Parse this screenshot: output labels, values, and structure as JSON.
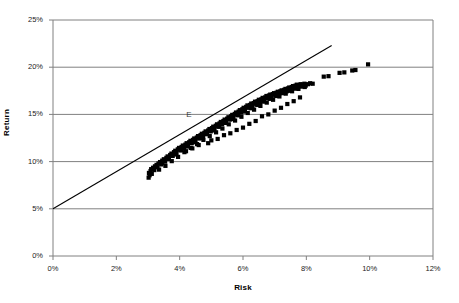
{
  "chart_data": {
    "type": "scatter",
    "title": "",
    "xlabel": "Risk",
    "ylabel": "Return",
    "xlim": [
      0,
      12
    ],
    "ylim": [
      0,
      25
    ],
    "x_ticks": [
      "0%",
      "2%",
      "4%",
      "6%",
      "8%",
      "10%",
      "12%"
    ],
    "x_tick_values": [
      0,
      2,
      4,
      6,
      8,
      10,
      12
    ],
    "y_ticks": [
      "0%",
      "5%",
      "10%",
      "15%",
      "20%",
      "25%"
    ],
    "y_tick_values": [
      0,
      5,
      10,
      15,
      20,
      25
    ],
    "grid": "horizontal",
    "legend": "none",
    "annotations": [
      {
        "label": "E",
        "x": 4.3,
        "y": 14.9
      }
    ],
    "series": [
      {
        "name": "Capital Market Line",
        "type": "line",
        "color": "#000000",
        "points": [
          [
            0,
            5.0
          ],
          [
            8.8,
            22.3
          ]
        ]
      },
      {
        "name": "Efficient frontier portfolios",
        "type": "scatter",
        "marker": "square",
        "color": "#000000",
        "points": [
          [
            3.02,
            8.3
          ],
          [
            3.05,
            8.55
          ],
          [
            3.03,
            8.8
          ],
          [
            3.08,
            9.0
          ],
          [
            3.12,
            8.7
          ],
          [
            3.1,
            9.2
          ],
          [
            3.16,
            9.35
          ],
          [
            3.2,
            9.1
          ],
          [
            3.22,
            9.5
          ],
          [
            3.27,
            9.65
          ],
          [
            3.3,
            9.4
          ],
          [
            3.33,
            9.8
          ],
          [
            3.38,
            9.95
          ],
          [
            3.42,
            9.7
          ],
          [
            3.45,
            10.1
          ],
          [
            3.5,
            10.25
          ],
          [
            3.54,
            10.0
          ],
          [
            3.58,
            10.4
          ],
          [
            3.62,
            10.55
          ],
          [
            3.66,
            10.3
          ],
          [
            3.7,
            10.7
          ],
          [
            3.74,
            10.85
          ],
          [
            3.78,
            10.6
          ],
          [
            3.82,
            11.0
          ],
          [
            3.86,
            11.15
          ],
          [
            3.9,
            10.9
          ],
          [
            3.94,
            11.3
          ],
          [
            3.98,
            11.45
          ],
          [
            4.02,
            11.2
          ],
          [
            4.06,
            11.55
          ],
          [
            4.1,
            11.7
          ],
          [
            4.14,
            11.45
          ],
          [
            4.18,
            11.8
          ],
          [
            4.22,
            11.95
          ],
          [
            4.26,
            11.7
          ],
          [
            4.3,
            12.05
          ],
          [
            4.34,
            12.2
          ],
          [
            4.38,
            11.95
          ],
          [
            4.42,
            12.3
          ],
          [
            4.46,
            12.45
          ],
          [
            4.5,
            12.2
          ],
          [
            4.54,
            12.55
          ],
          [
            4.58,
            12.7
          ],
          [
            4.62,
            12.45
          ],
          [
            4.66,
            12.8
          ],
          [
            4.7,
            12.95
          ],
          [
            4.74,
            12.7
          ],
          [
            4.78,
            13.05
          ],
          [
            4.82,
            13.2
          ],
          [
            4.86,
            12.95
          ],
          [
            4.9,
            13.3
          ],
          [
            4.94,
            13.45
          ],
          [
            4.98,
            13.2
          ],
          [
            5.02,
            13.55
          ],
          [
            5.06,
            13.7
          ],
          [
            5.1,
            13.45
          ],
          [
            5.14,
            13.8
          ],
          [
            5.18,
            13.95
          ],
          [
            5.22,
            13.7
          ],
          [
            5.26,
            14.05
          ],
          [
            5.3,
            14.2
          ],
          [
            5.34,
            13.95
          ],
          [
            5.38,
            14.3
          ],
          [
            5.42,
            14.45
          ],
          [
            5.46,
            14.2
          ],
          [
            5.5,
            14.55
          ],
          [
            5.54,
            14.7
          ],
          [
            5.58,
            14.45
          ],
          [
            5.62,
            14.8
          ],
          [
            5.66,
            14.95
          ],
          [
            5.7,
            14.7
          ],
          [
            5.74,
            15.05
          ],
          [
            5.78,
            15.2
          ],
          [
            5.82,
            14.95
          ],
          [
            5.86,
            15.3
          ],
          [
            5.9,
            15.45
          ],
          [
            5.94,
            15.2
          ],
          [
            5.98,
            15.55
          ],
          [
            6.02,
            15.7
          ],
          [
            6.06,
            15.45
          ],
          [
            6.1,
            15.8
          ],
          [
            6.14,
            15.95
          ],
          [
            6.18,
            15.7
          ],
          [
            6.22,
            16.0
          ],
          [
            6.26,
            16.15
          ],
          [
            6.3,
            15.9
          ],
          [
            6.34,
            16.2
          ],
          [
            6.38,
            16.35
          ],
          [
            6.42,
            16.1
          ],
          [
            6.46,
            16.4
          ],
          [
            6.5,
            16.55
          ],
          [
            6.54,
            16.3
          ],
          [
            6.58,
            16.6
          ],
          [
            6.62,
            16.75
          ],
          [
            6.66,
            16.5
          ],
          [
            6.7,
            16.8
          ],
          [
            6.74,
            16.95
          ],
          [
            6.78,
            16.7
          ],
          [
            6.82,
            17.0
          ],
          [
            6.86,
            17.1
          ],
          [
            6.9,
            16.85
          ],
          [
            6.94,
            17.15
          ],
          [
            6.98,
            17.25
          ],
          [
            7.02,
            17.0
          ],
          [
            7.06,
            17.3
          ],
          [
            7.1,
            17.4
          ],
          [
            7.14,
            17.15
          ],
          [
            7.18,
            17.45
          ],
          [
            7.22,
            17.55
          ],
          [
            7.26,
            17.3
          ],
          [
            7.3,
            17.6
          ],
          [
            7.34,
            17.7
          ],
          [
            7.38,
            17.45
          ],
          [
            7.42,
            17.75
          ],
          [
            7.46,
            17.85
          ],
          [
            7.5,
            17.6
          ],
          [
            7.54,
            17.9
          ],
          [
            7.58,
            18.0
          ],
          [
            7.62,
            17.75
          ],
          [
            7.66,
            18.05
          ],
          [
            7.7,
            18.15
          ],
          [
            7.74,
            17.9
          ],
          [
            7.78,
            18.1
          ],
          [
            7.82,
            18.2
          ],
          [
            7.86,
            18.0
          ],
          [
            7.9,
            18.15
          ],
          [
            7.94,
            18.25
          ],
          [
            7.98,
            18.05
          ],
          [
            8.05,
            18.2
          ],
          [
            8.12,
            18.3
          ],
          [
            8.2,
            18.25
          ],
          [
            8.55,
            19.0
          ],
          [
            8.7,
            19.05
          ],
          [
            9.05,
            19.4
          ],
          [
            9.2,
            19.45
          ],
          [
            9.45,
            19.65
          ],
          [
            9.55,
            19.7
          ],
          [
            9.95,
            20.3
          ],
          [
            3.35,
            9.15
          ],
          [
            3.55,
            9.55
          ],
          [
            3.75,
            10.05
          ],
          [
            3.95,
            10.5
          ],
          [
            4.15,
            11.0
          ],
          [
            4.35,
            11.45
          ],
          [
            4.55,
            11.85
          ],
          [
            4.75,
            12.3
          ],
          [
            4.95,
            12.7
          ],
          [
            5.15,
            13.1
          ],
          [
            5.35,
            13.5
          ],
          [
            5.55,
            13.95
          ],
          [
            5.75,
            14.35
          ],
          [
            5.95,
            14.75
          ],
          [
            6.15,
            15.15
          ],
          [
            6.35,
            15.5
          ],
          [
            6.55,
            15.9
          ],
          [
            6.75,
            16.25
          ],
          [
            6.95,
            16.55
          ],
          [
            7.15,
            16.9
          ],
          [
            7.35,
            17.2
          ],
          [
            7.55,
            17.45
          ],
          [
            7.75,
            17.7
          ],
          [
            7.95,
            17.9
          ],
          [
            3.45,
            9.85
          ],
          [
            3.65,
            10.3
          ],
          [
            3.85,
            10.75
          ],
          [
            4.05,
            11.2
          ],
          [
            4.25,
            11.6
          ],
          [
            4.45,
            12.05
          ],
          [
            4.65,
            12.5
          ],
          [
            4.85,
            12.9
          ],
          [
            5.05,
            13.3
          ],
          [
            5.25,
            13.7
          ],
          [
            5.45,
            14.1
          ],
          [
            5.65,
            14.5
          ],
          [
            5.85,
            14.9
          ],
          [
            6.05,
            15.3
          ],
          [
            6.25,
            15.65
          ],
          [
            6.45,
            16.0
          ],
          [
            6.65,
            16.35
          ],
          [
            6.85,
            16.65
          ],
          [
            7.05,
            16.95
          ],
          [
            7.25,
            17.25
          ],
          [
            7.45,
            17.5
          ],
          [
            7.65,
            17.75
          ],
          [
            7.85,
            17.95
          ],
          [
            4.9,
            11.95
          ],
          [
            5.2,
            12.4
          ],
          [
            5.6,
            13.0
          ],
          [
            6.0,
            13.6
          ],
          [
            6.4,
            14.3
          ],
          [
            6.8,
            15.0
          ],
          [
            7.2,
            15.7
          ],
          [
            7.6,
            16.4
          ],
          [
            6.6,
            14.8
          ],
          [
            7.0,
            15.4
          ],
          [
            7.4,
            16.1
          ],
          [
            7.8,
            16.8
          ],
          [
            5.8,
            13.35
          ],
          [
            6.2,
            14.0
          ],
          [
            5.4,
            12.8
          ],
          [
            5.0,
            12.25
          ],
          [
            4.6,
            11.75
          ],
          [
            4.4,
            11.4
          ],
          [
            4.2,
            11.1
          ]
        ]
      }
    ]
  },
  "axes": {
    "y_title": "Return",
    "x_title": "Risk"
  }
}
